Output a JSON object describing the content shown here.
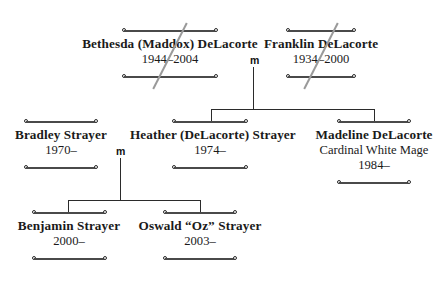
{
  "diagram": {
    "kind": "family-tree",
    "background_color": "#ffffff",
    "rule_color": "#4a4a4a",
    "line_color": "#2b2b2b",
    "strike_color": "#9a9a9a",
    "marriage_marker": "m"
  },
  "people": {
    "bethesda": {
      "name": "Bethesda (Maddox) DeLacorte",
      "dates": "1944–2004",
      "deceased": true
    },
    "franklin": {
      "name": "Franklin DeLacorte",
      "dates": "1934–2000",
      "deceased": true
    },
    "bradley": {
      "name": "Bradley Strayer",
      "dates": "1970–",
      "deceased": false
    },
    "heather": {
      "name": "Heather (DeLacorte) Strayer",
      "dates": "1974–",
      "deceased": false
    },
    "madeline": {
      "name": "Madeline DeLacorte",
      "title": "Cardinal White Mage",
      "dates": "1984–",
      "deceased": false
    },
    "benjamin": {
      "name": "Benjamin Strayer",
      "dates": "2000–",
      "deceased": false
    },
    "oswald": {
      "name": "Oswald “Oz” Strayer",
      "dates": "2003–",
      "deceased": false
    }
  },
  "marriages": [
    {
      "id": "bethesda-franklin",
      "label": "m"
    },
    {
      "id": "bradley-heather",
      "label": "m"
    }
  ]
}
